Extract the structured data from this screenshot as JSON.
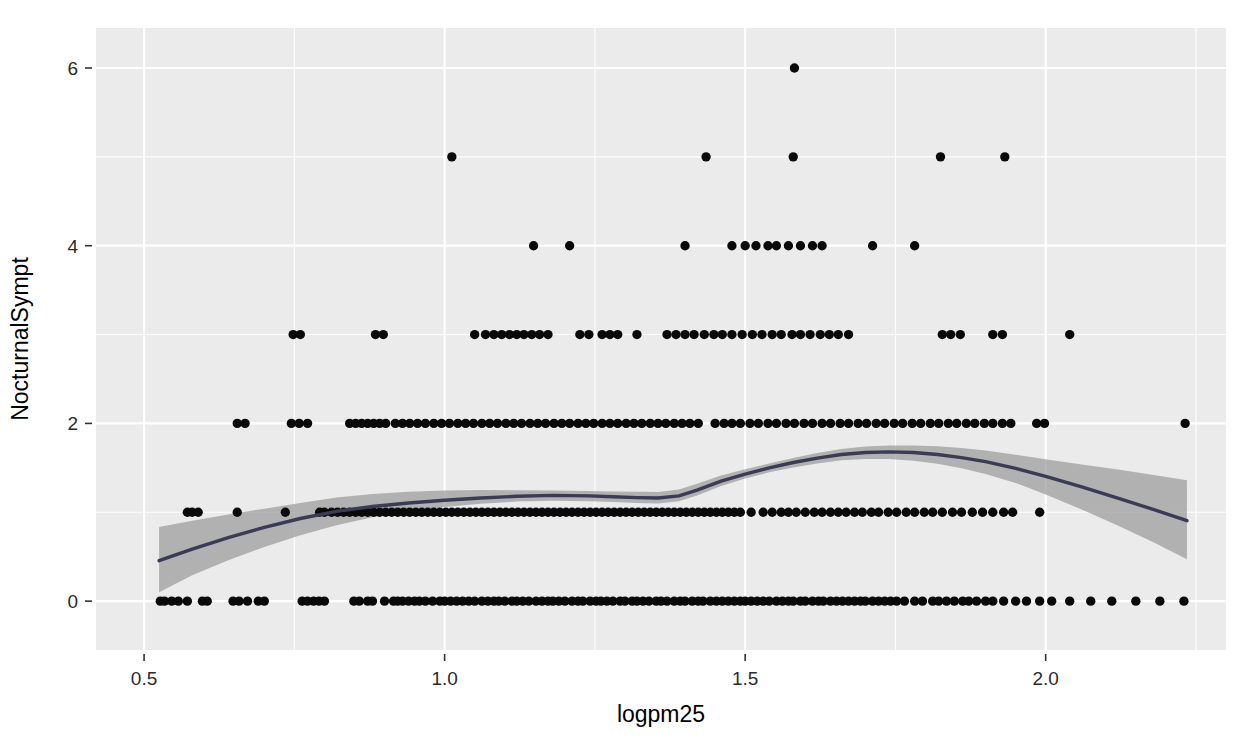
{
  "chart_data": {
    "type": "scatter",
    "title": "",
    "subtitle": "",
    "xlabel": "logpm25",
    "ylabel": "NocturnalSympt",
    "xlim": [
      0.42,
      2.3
    ],
    "ylim": [
      -0.55,
      6.45
    ],
    "xticks": [
      0.5,
      1.0,
      1.5,
      2.0
    ],
    "xticklabels": [
      "0.5",
      "1.0",
      "1.5",
      "2.0"
    ],
    "yticks": [
      0,
      2,
      4,
      6
    ],
    "yticklabels": [
      "0",
      "2",
      "4",
      "6"
    ],
    "grid": true,
    "grid_major_color": "#ffffff",
    "grid_minor_color": "#ffffff",
    "panel_background": "#ebebeb",
    "legend": "none",
    "point_color": "#0a0a0a",
    "point_size": 6,
    "smooth": {
      "method": "loess",
      "line_color": "#3b3b55",
      "band_color": "#9a9a9a",
      "band_opacity": 0.72,
      "x": [
        0.525,
        0.58,
        0.64,
        0.7,
        0.76,
        0.82,
        0.88,
        0.94,
        1.0,
        1.06,
        1.12,
        1.18,
        1.24,
        1.28,
        1.32,
        1.355,
        1.39,
        1.42,
        1.46,
        1.5,
        1.54,
        1.58,
        1.62,
        1.66,
        1.7,
        1.74,
        1.78,
        1.82,
        1.86,
        1.9,
        1.95,
        2.0,
        2.06,
        2.12,
        2.18,
        2.235
      ],
      "fit": [
        0.455,
        0.585,
        0.715,
        0.83,
        0.93,
        1.01,
        1.065,
        1.105,
        1.135,
        1.16,
        1.18,
        1.19,
        1.185,
        1.175,
        1.165,
        1.16,
        1.185,
        1.25,
        1.35,
        1.43,
        1.5,
        1.56,
        1.61,
        1.65,
        1.672,
        1.68,
        1.672,
        1.65,
        1.615,
        1.57,
        1.495,
        1.405,
        1.285,
        1.16,
        1.03,
        0.905
      ],
      "lower": [
        0.1,
        0.29,
        0.46,
        0.61,
        0.74,
        0.855,
        0.945,
        1.01,
        1.06,
        1.095,
        1.12,
        1.13,
        1.125,
        1.115,
        1.105,
        1.1,
        1.125,
        1.19,
        1.295,
        1.38,
        1.45,
        1.505,
        1.55,
        1.585,
        1.6,
        1.6,
        1.58,
        1.545,
        1.495,
        1.43,
        1.33,
        1.2,
        1.03,
        0.85,
        0.66,
        0.47
      ],
      "upper": [
        0.835,
        0.905,
        0.975,
        1.04,
        1.105,
        1.165,
        1.205,
        1.23,
        1.245,
        1.25,
        1.248,
        1.245,
        1.24,
        1.235,
        1.23,
        1.228,
        1.255,
        1.32,
        1.415,
        1.485,
        1.55,
        1.612,
        1.668,
        1.712,
        1.74,
        1.752,
        1.752,
        1.742,
        1.722,
        1.695,
        1.648,
        1.598,
        1.538,
        1.48,
        1.42,
        1.36
      ]
    },
    "point_rows": [
      {
        "y": 0,
        "x": [
          0.527,
          0.534,
          0.546,
          0.557,
          0.572,
          0.597,
          0.605,
          0.648,
          0.658,
          0.672,
          0.69,
          0.7,
          0.763,
          0.772,
          0.782,
          0.791,
          0.8,
          0.849,
          0.858,
          0.872,
          0.88,
          0.9,
          0.915,
          0.922,
          0.93,
          0.94,
          0.95,
          0.958,
          0.968,
          0.98,
          0.992,
          1.0,
          1.01,
          1.02,
          1.03,
          1.04,
          1.05,
          1.062,
          1.072,
          1.082,
          1.09,
          1.1,
          1.112,
          1.12,
          1.13,
          1.14,
          1.152,
          1.162,
          1.172,
          1.18,
          1.19,
          1.2,
          1.212,
          1.222,
          1.23,
          1.242,
          1.252,
          1.26,
          1.27,
          1.28,
          1.292,
          1.3,
          1.312,
          1.32,
          1.33,
          1.34,
          1.352,
          1.36,
          1.37,
          1.382,
          1.392,
          1.4,
          1.412,
          1.422,
          1.43,
          1.442,
          1.452,
          1.462,
          1.472,
          1.482,
          1.492,
          1.5,
          1.51,
          1.52,
          1.53,
          1.54,
          1.552,
          1.562,
          1.572,
          1.58,
          1.592,
          1.6,
          1.612,
          1.622,
          1.63,
          1.642,
          1.652,
          1.662,
          1.672,
          1.682,
          1.692,
          1.7,
          1.712,
          1.722,
          1.732,
          1.742,
          1.752,
          1.765,
          1.782,
          1.795,
          1.812,
          1.822,
          1.835,
          1.848,
          1.862,
          1.872,
          1.885,
          1.9,
          1.912,
          1.93,
          1.95,
          1.968,
          1.99,
          2.01,
          2.04,
          2.075,
          2.11,
          2.15,
          2.19,
          2.23
        ]
      },
      {
        "y": 1,
        "x": [
          0.572,
          0.58,
          0.59,
          0.655,
          0.735,
          0.792,
          0.8,
          0.812,
          0.822,
          0.832,
          0.842,
          0.852,
          0.862,
          0.872,
          0.882,
          0.892,
          0.902,
          0.912,
          0.922,
          0.932,
          0.942,
          0.952,
          0.962,
          0.972,
          0.982,
          0.992,
          1.002,
          1.012,
          1.022,
          1.032,
          1.042,
          1.052,
          1.062,
          1.072,
          1.082,
          1.092,
          1.102,
          1.112,
          1.122,
          1.132,
          1.142,
          1.152,
          1.162,
          1.172,
          1.182,
          1.192,
          1.202,
          1.212,
          1.222,
          1.232,
          1.242,
          1.252,
          1.262,
          1.272,
          1.282,
          1.292,
          1.302,
          1.312,
          1.322,
          1.332,
          1.342,
          1.352,
          1.362,
          1.372,
          1.382,
          1.392,
          1.402,
          1.412,
          1.422,
          1.432,
          1.442,
          1.452,
          1.462,
          1.472,
          1.482,
          1.492,
          1.51,
          1.53,
          1.545,
          1.56,
          1.572,
          1.585,
          1.6,
          1.615,
          1.628,
          1.642,
          1.655,
          1.668,
          1.682,
          1.695,
          1.71,
          1.722,
          1.738,
          1.752,
          1.768,
          1.782,
          1.798,
          1.812,
          1.828,
          1.845,
          1.86,
          1.878,
          1.895,
          1.912,
          1.93,
          1.945,
          1.99
        ]
      },
      {
        "y": 2,
        "x": [
          0.655,
          0.668,
          0.745,
          0.758,
          0.772,
          0.842,
          0.852,
          0.862,
          0.872,
          0.882,
          0.892,
          0.902,
          0.918,
          0.93,
          0.942,
          0.955,
          0.968,
          0.982,
          0.995,
          1.008,
          1.022,
          1.035,
          1.048,
          1.062,
          1.075,
          1.088,
          1.102,
          1.115,
          1.128,
          1.142,
          1.155,
          1.168,
          1.182,
          1.195,
          1.208,
          1.222,
          1.235,
          1.248,
          1.262,
          1.275,
          1.288,
          1.302,
          1.315,
          1.328,
          1.342,
          1.355,
          1.368,
          1.382,
          1.395,
          1.408,
          1.422,
          1.45,
          1.465,
          1.478,
          1.492,
          1.508,
          1.522,
          1.538,
          1.552,
          1.568,
          1.582,
          1.598,
          1.612,
          1.628,
          1.642,
          1.658,
          1.672,
          1.688,
          1.702,
          1.718,
          1.732,
          1.748,
          1.762,
          1.778,
          1.792,
          1.808,
          1.822,
          1.838,
          1.852,
          1.868,
          1.882,
          1.898,
          1.912,
          1.928,
          1.942,
          1.985,
          1.998,
          2.232
        ]
      },
      {
        "y": 3,
        "x": [
          0.748,
          0.76,
          0.885,
          0.898,
          1.05,
          1.068,
          1.082,
          1.095,
          1.108,
          1.12,
          1.132,
          1.145,
          1.158,
          1.172,
          1.225,
          1.24,
          1.262,
          1.275,
          1.288,
          1.32,
          1.37,
          1.385,
          1.4,
          1.415,
          1.432,
          1.448,
          1.462,
          1.478,
          1.495,
          1.512,
          1.528,
          1.545,
          1.56,
          1.578,
          1.592,
          1.608,
          1.625,
          1.64,
          1.655,
          1.672,
          1.828,
          1.842,
          1.858,
          1.912,
          1.928,
          2.04
        ]
      },
      {
        "y": 4,
        "x": [
          1.148,
          1.208,
          1.4,
          1.478,
          1.5,
          1.518,
          1.538,
          1.552,
          1.572,
          1.592,
          1.612,
          1.628,
          1.712,
          1.782
        ]
      },
      {
        "y": 5,
        "x": [
          1.012,
          1.435,
          1.58,
          1.825,
          1.932
        ]
      },
      {
        "y": 6,
        "x": [
          1.582
        ]
      }
    ]
  }
}
